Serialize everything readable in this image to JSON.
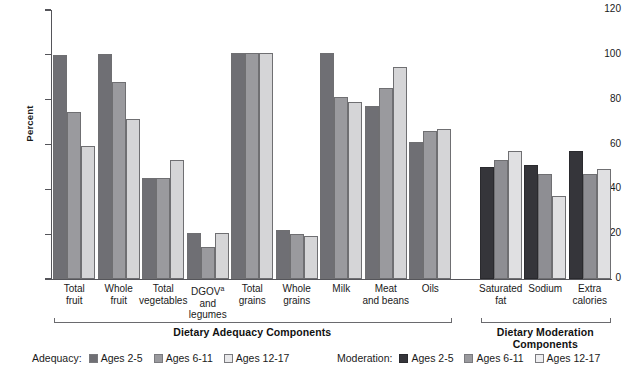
{
  "chart_data": {
    "type": "bar",
    "title": "",
    "xlabel": "",
    "ylabel": "Percent",
    "ylim": [
      0,
      120
    ],
    "yticks": [
      0,
      20,
      40,
      60,
      80,
      100,
      120
    ],
    "grid": false,
    "legend_position": "bottom",
    "categories": [
      "Total fruit",
      "Whole fruit",
      "Total vegetables",
      "DGOV and legumes",
      "Total grains",
      "Whole grains",
      "Milk",
      "Meat and beans",
      "Oils",
      "Saturated fat",
      "Sodium",
      "Extra calories"
    ],
    "category_lines": [
      [
        "Total",
        "fruit"
      ],
      [
        "Whole",
        "fruit"
      ],
      [
        "Total",
        "vegetables"
      ],
      [
        "DGOV",
        "and",
        "legumes"
      ],
      [
        "Total",
        "grains"
      ],
      [
        "Whole",
        "grains"
      ],
      [
        "Milk"
      ],
      [
        "Meat",
        "and beans"
      ],
      [
        "Oils"
      ],
      [
        "Saturated",
        "fat"
      ],
      [
        "Sodium"
      ],
      [
        "Extra",
        "calories"
      ]
    ],
    "series": [
      {
        "name": "Ages 2-5",
        "values": [
          100,
          100.5,
          45,
          20.5,
          101,
          22,
          101,
          77,
          61,
          50,
          51,
          57
        ]
      },
      {
        "name": "Ages 6-11",
        "values": [
          74.5,
          88,
          45,
          14.5,
          101,
          20,
          81,
          85,
          66,
          53,
          47,
          47
        ]
      },
      {
        "name": "Ages 12-17",
        "values": [
          59.5,
          71.5,
          53,
          20.5,
          101,
          19,
          79,
          94.5,
          67,
          57,
          37,
          49
        ]
      }
    ],
    "sections": [
      {
        "label": "Dietary Adequacy Components",
        "start_index": 0,
        "end_index": 8
      },
      {
        "label": "Dietary Moderation Components",
        "start_index": 9,
        "end_index": 11
      }
    ],
    "footnote_marker": "a"
  },
  "legend": {
    "adequacy": {
      "title": "Adequacy:",
      "items": [
        {
          "label": "Ages 2-5",
          "swatch": "a0"
        },
        {
          "label": "Ages 6-11",
          "swatch": "a1"
        },
        {
          "label": "Ages 12-17",
          "swatch": "a2"
        }
      ]
    },
    "moderation": {
      "title": "Moderation:",
      "items": [
        {
          "label": "Ages 2-5",
          "swatch": "m0"
        },
        {
          "label": "Ages 6-11",
          "swatch": "m1"
        },
        {
          "label": "Ages 12-17",
          "swatch": "m2"
        }
      ]
    }
  },
  "colors": {
    "series_adequacy": [
      "#6f6f74",
      "#9a9a9e",
      "#d5d5d7"
    ],
    "series_moderation": [
      "#35353a",
      "#8e8e93",
      "#e0e0e2"
    ],
    "axis": "#55555a",
    "text": "#1a1a1a"
  }
}
